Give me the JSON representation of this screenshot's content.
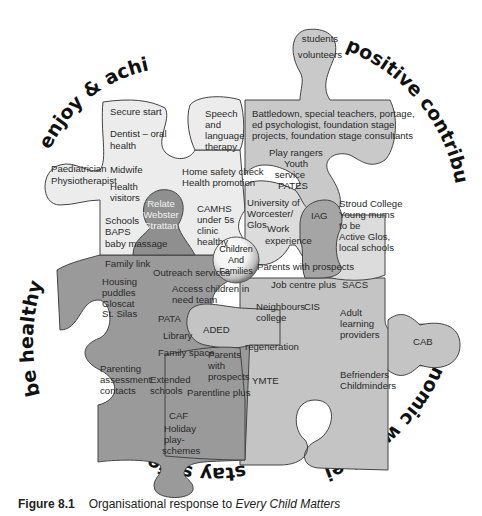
{
  "diagram": {
    "title": "Organisational response to Every Child Matters",
    "themes": {
      "enjoy": "enjoy & achieve",
      "positive": "positive contribution",
      "healthy": "be healthy",
      "safe": "stay safe",
      "economic": "economic well-being"
    },
    "hub": {
      "line1": "Children",
      "line2": "And",
      "line3": "Families"
    },
    "pieces": {
      "health_light": {
        "fill": "#ececec",
        "labels": [
          "Secure start",
          "Dentist – oral",
          "health",
          "Paediatrician",
          "Physiotherapist",
          "Midwife",
          "Health",
          "visitors",
          "Schools",
          "BAPS",
          "baby massage",
          "Home safety check",
          "Health promotion",
          "CAMHS",
          "under 5s",
          "clinic",
          "healthy"
        ]
      },
      "speech": {
        "fill": "#ececec",
        "labels": [
          "Speech",
          "and",
          "language",
          "therapy"
        ]
      },
      "relate": {
        "fill": "#8f8f8f",
        "labels": [
          "Relate",
          "Webster",
          "Strattan"
        ]
      },
      "positive_top": {
        "fill": "#c9c9c9",
        "labels": [
          "students",
          "volunteers",
          "Battledown, special teachers, portage,",
          "ed psychologist, foundation stage",
          "projects, foundation stage consultants",
          "Play rangers",
          "Youth",
          "service",
          "PATES"
        ]
      },
      "university": {
        "fill": "#dcdcdc",
        "labels": [
          "University of",
          "Worcester/",
          "Glos",
          "Work",
          "experience",
          "Stroud College",
          "Young  mums",
          "to be",
          "Active Glos,",
          "local schools"
        ]
      },
      "iag": {
        "fill": "#a5a5a5",
        "labels": [
          "IAG"
        ]
      },
      "safe_dark": {
        "fill": "#9a9a9a",
        "labels": [
          "Family link",
          "Outreach services",
          "Housing",
          "puddles",
          "Gloscat",
          "St. Silas",
          "Access children in",
          "need team",
          "PATA",
          "Library",
          "Family space",
          "Parents",
          "with",
          "prospects",
          "Parenting",
          "assessment",
          "contacts",
          "Extended",
          "schools",
          "Parentline plus",
          "CAF",
          "Holiday",
          "play-",
          "schemes"
        ]
      },
      "economic": {
        "fill": "#c4c4c4",
        "labels": [
          "Parents with prospects",
          "Job centre plus",
          "SACS",
          "Neighbours",
          "college",
          "CIS",
          "Adult",
          "learning",
          "providers",
          "ADED",
          "regeneration",
          "YMTE",
          "Befrienders",
          "Childminders",
          "CAB"
        ]
      }
    }
  },
  "caption": {
    "figure_label": "Figure 8.1",
    "text_plain": "Organisational response to ",
    "text_italic": "Every Child Matters"
  }
}
